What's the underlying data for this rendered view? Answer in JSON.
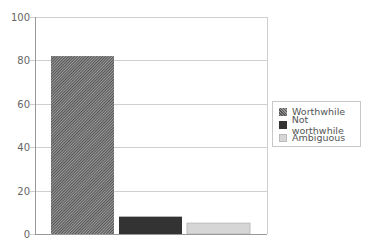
{
  "chart_data": {
    "type": "bar",
    "title": "",
    "xlabel": "",
    "ylabel": "",
    "categories": [
      "Worthwhile",
      "Not worthwhile",
      "Ambiguous"
    ],
    "values": [
      82,
      8,
      5
    ],
    "ylim": [
      0,
      100
    ],
    "yticks": [
      0,
      20,
      40,
      60,
      80,
      100
    ],
    "grid": true,
    "legend_position": "right",
    "colors": {
      "Worthwhile": "#777777",
      "Not worthwhile": "#333333",
      "Ambiguous": "#d6d6d6"
    },
    "patterns": {
      "Worthwhile": "diagonal-hatch"
    }
  },
  "legend": {
    "items": [
      {
        "label": "Worthwhile"
      },
      {
        "label": "Not worthwhile"
      },
      {
        "label": "Ambiguous"
      }
    ]
  }
}
